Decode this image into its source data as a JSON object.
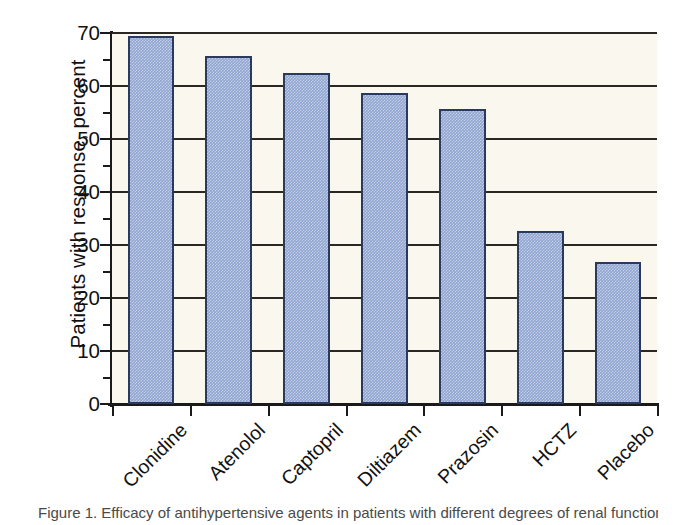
{
  "chart_data": {
    "type": "bar",
    "title": "",
    "xlabel": "",
    "ylabel": "Patients with response, percent",
    "categories": [
      "Clonidine",
      "Atenolol",
      "Captopril",
      "Diltiazem",
      "Prazosin",
      "HCTZ",
      "Placebo"
    ],
    "values": [
      69.4,
      65.7,
      62.4,
      58.7,
      55.6,
      32.7,
      26.8
    ],
    "ylim": [
      0,
      70
    ],
    "ytick_labels": [
      "0",
      "10",
      "20",
      "30",
      "40",
      "50",
      "60",
      "70"
    ],
    "ytick_values": [
      0,
      10,
      20,
      30,
      40,
      50,
      60,
      70
    ],
    "yminor_values": [
      5,
      15,
      25,
      35,
      45,
      55,
      65
    ],
    "grid": "horizontal",
    "legend": "none",
    "series_name": "Patients with response",
    "bar_fill_color": "#8fa4d0",
    "bar_edge_color": "#2b3a5c",
    "plot_background_color": "#faf8ee",
    "gridline_color": "#2b2723",
    "axis_color": "#1a1a1a",
    "label_rotation_degrees": -45
  },
  "caption": {
    "text": "Figure 1. Efficacy of antihypertensive agents in patients with different degrees of renal function."
  }
}
